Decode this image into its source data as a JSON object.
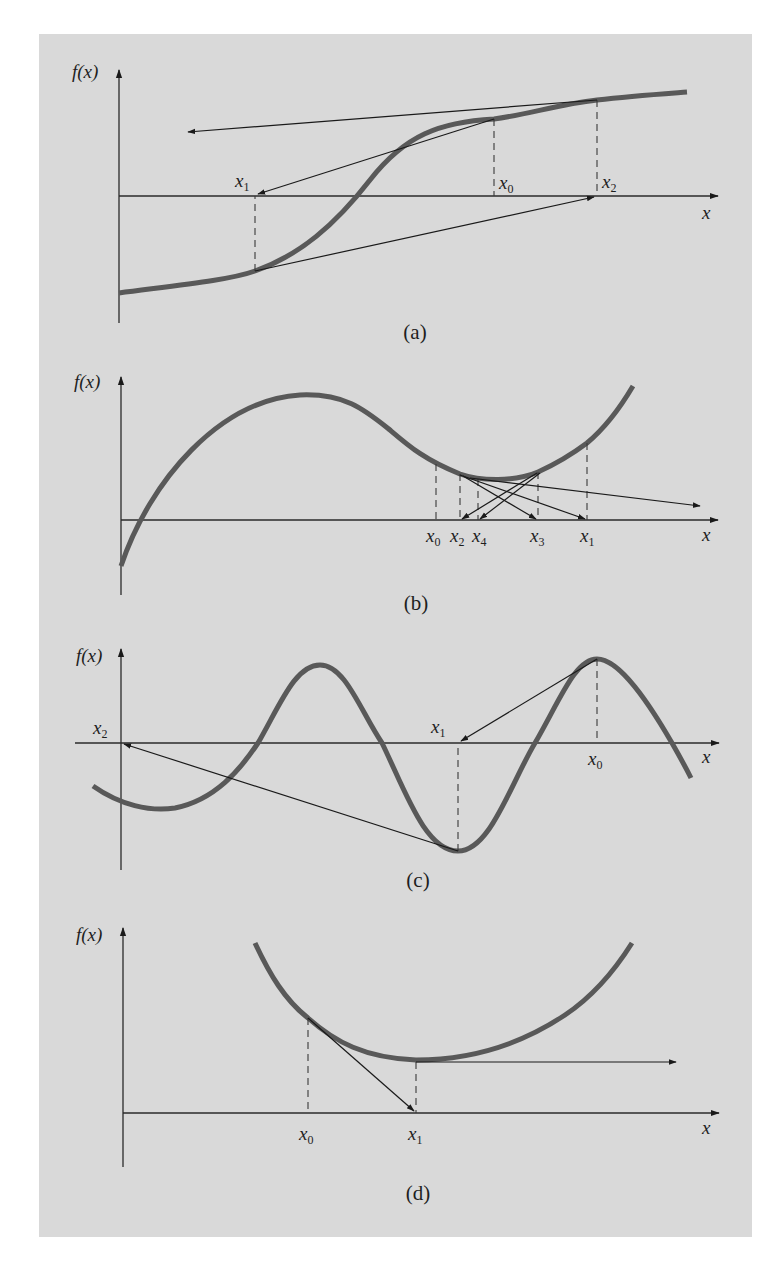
{
  "figure": {
    "background": "#d9d9d9",
    "curve_color": "#595959",
    "y_axis_label": "f(x)",
    "x_axis_label": "x"
  },
  "panels": [
    {
      "id": "a",
      "caption": "(a)",
      "description": "Inflection point near root: Newton-Raphson iterations diverge",
      "points": [
        {
          "label": "x",
          "sub": "1"
        },
        {
          "label": "x",
          "sub": "0"
        },
        {
          "label": "x",
          "sub": "2"
        }
      ]
    },
    {
      "id": "b",
      "caption": "(b)",
      "description": "Oscillation around a local minimum",
      "points": [
        {
          "label": "x",
          "sub": "0"
        },
        {
          "label": "x",
          "sub": "2"
        },
        {
          "label": "x",
          "sub": "4"
        },
        {
          "label": "x",
          "sub": "3"
        },
        {
          "label": "x",
          "sub": "1"
        }
      ]
    },
    {
      "id": "c",
      "caption": "(c)",
      "description": "Initial guess near one root jumps to a distant root",
      "points": [
        {
          "label": "x",
          "sub": "2"
        },
        {
          "label": "x",
          "sub": "1"
        },
        {
          "label": "x",
          "sub": "0"
        }
      ]
    },
    {
      "id": "d",
      "caption": "(d)",
      "description": "Zero slope: tangent is horizontal, division by zero",
      "points": [
        {
          "label": "x",
          "sub": "0"
        },
        {
          "label": "x",
          "sub": "1"
        }
      ]
    }
  ]
}
